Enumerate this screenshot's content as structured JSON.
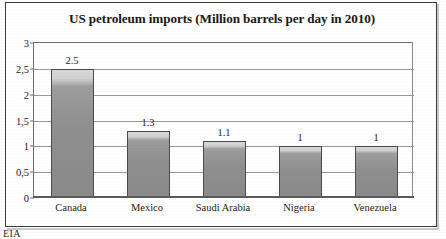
{
  "chart_data": {
    "type": "bar",
    "title": "US petroleum imports (Million barrels per day in 2010)",
    "xlabel": "",
    "ylabel": "",
    "categories": [
      "Canada",
      "Mexico",
      "Saudi Arabia",
      "Nigeria",
      "Venezuela"
    ],
    "values": [
      2.5,
      1.3,
      1.1,
      1,
      1
    ],
    "value_labels": [
      "2.5",
      "1.3",
      "1.1",
      "1",
      "1"
    ],
    "ylim": [
      0,
      3
    ],
    "ytick_values": [
      0,
      0.5,
      1,
      1.5,
      2,
      2.5,
      3
    ],
    "ytick_labels": [
      "0",
      "0,5",
      "1",
      "1,5",
      "2",
      "2,5",
      "3"
    ],
    "grid": true,
    "legend": false,
    "bar_color": "#8f8f8f",
    "bar_border_color": "#4a4a4a",
    "plot_background": "#ffffff",
    "gridline_color": "#9a9a9a",
    "text_color": "#1d1d1d"
  },
  "source": {
    "caption": "EIA"
  }
}
